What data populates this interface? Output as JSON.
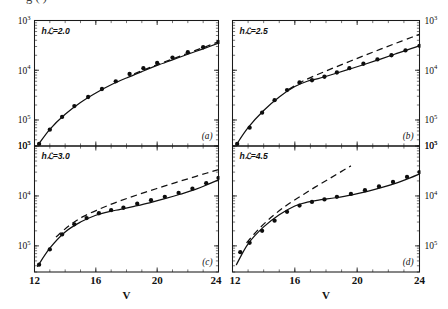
{
  "figure": {
    "clipped_caption_line": "g                                        (      )",
    "xlabel": "V",
    "panel_letters": [
      "(a)",
      "(b)",
      "(c)",
      "(d)"
    ],
    "y_tick_labels": [
      "10",
      "10",
      "10"
    ],
    "y_tick_exponents": [
      "5",
      "4",
      "3"
    ],
    "x_tick_labels": [
      "12",
      "16",
      "20",
      "24"
    ]
  },
  "chart_data": {
    "type": "line",
    "title": "",
    "xlabel": "V",
    "ylabel": "",
    "xlim": [
      12,
      24
    ],
    "ylim": [
      300,
      100000
    ],
    "yscale": "log",
    "xscale": "linear",
    "grid": false,
    "legend": "none",
    "xticks": [
      12,
      16,
      20,
      24
    ],
    "yticks": [
      1000,
      10000,
      100000
    ],
    "ytick_labels": [
      "10^3",
      "10^4",
      "10^5"
    ],
    "panels": [
      {
        "letter": "(a)",
        "label": "hℒ=2.0",
        "parameter": "hL",
        "parameter_value": 2.0,
        "series": [
          {
            "name": "data",
            "style": "filled-circles",
            "x": [
              12.3,
              13.0,
              13.8,
              14.6,
              15.5,
              16.4,
              17.3,
              18.2,
              19.1,
              20.0,
              21.0,
              22.0,
              23.0,
              24.0
            ],
            "y": [
              330,
              640,
              1150,
              1900,
              2900,
              4200,
              6000,
              8400,
              11000,
              14000,
              18000,
              23000,
              29000,
              37000
            ]
          },
          {
            "name": "solid-theory",
            "style": "solid-line",
            "x": [
              12.25,
              13.0,
              14.0,
              15.0,
              16.0,
              17.0,
              18.0,
              19.0,
              20.0,
              21.0,
              22.0,
              23.0,
              24.0
            ],
            "y": [
              320,
              650,
              1300,
              2250,
              3500,
              5100,
              7000,
              9400,
              12500,
              16200,
              21000,
              27000,
              35000
            ]
          },
          {
            "name": "dashed-theory",
            "style": "dashed-line",
            "x": [
              18.5,
              19.5,
              20.5,
              21.5,
              22.5,
              23.5,
              24.0
            ],
            "y": [
              8500,
              11300,
              14800,
              19200,
              25000,
              32500,
              37500
            ]
          }
        ]
      },
      {
        "letter": "(b)",
        "label": "hℒ=2.5",
        "parameter": "hL",
        "parameter_value": 2.5,
        "series": [
          {
            "name": "data",
            "style": "filled-circles",
            "x": [
              12.3,
              13.1,
              13.9,
              14.7,
              15.5,
              16.3,
              17.1,
              17.9,
              18.7,
              19.5,
              20.4,
              21.3,
              22.2,
              23.1,
              24.0
            ],
            "y": [
              330,
              700,
              1400,
              2500,
              4000,
              5700,
              6300,
              7400,
              9000,
              11000,
              13500,
              16500,
              20000,
              25000,
              31000
            ]
          },
          {
            "name": "solid-theory",
            "style": "solid-line",
            "x": [
              12.25,
              13.0,
              14.0,
              15.0,
              16.0,
              16.8,
              17.5,
              18.5,
              19.5,
              20.5,
              21.5,
              22.5,
              23.5,
              24.0
            ],
            "y": [
              320,
              700,
              1550,
              2900,
              4700,
              6000,
              6800,
              8400,
              10500,
              13200,
              16800,
              21500,
              27500,
              31000
            ]
          },
          {
            "name": "dashed-theory",
            "style": "dashed-line",
            "x": [
              15.6,
              16.5,
              17.5,
              18.5,
              19.5,
              20.5,
              21.5,
              22.5,
              23.5,
              24.0
            ],
            "y": [
              4100,
              6000,
              8300,
              11200,
              15000,
              20000,
              26500,
              35000,
              46000,
              53000
            ]
          }
        ]
      },
      {
        "letter": "(c)",
        "label": "hℒ=3.0",
        "parameter": "hL",
        "parameter_value": 3.0,
        "series": [
          {
            "name": "data",
            "style": "filled-circles",
            "x": [
              12.3,
              13.0,
              13.8,
              14.6,
              15.4,
              16.2,
              17.0,
              17.8,
              18.7,
              19.6,
              20.5,
              21.4,
              22.3,
              23.2,
              24.0
            ],
            "y": [
              420,
              850,
              1700,
              2700,
              3600,
              4500,
              5200,
              5800,
              7000,
              8200,
              9600,
              11500,
              14000,
              18000,
              23000
            ]
          },
          {
            "name": "solid-theory",
            "style": "solid-line",
            "x": [
              12.2,
              13.0,
              14.0,
              15.0,
              16.0,
              16.8,
              17.6,
              18.5,
              19.5,
              20.5,
              21.5,
              22.5,
              23.3,
              24.0
            ],
            "y": [
              390,
              900,
              1900,
              3000,
              4100,
              4800,
              5400,
              6200,
              7300,
              8800,
              10800,
              13500,
              17000,
              21000
            ]
          },
          {
            "name": "dashed-theory",
            "style": "dashed-line",
            "x": [
              13.4,
              14.3,
              15.2,
              16.2,
              17.2,
              18.2,
              19.2,
              20.2,
              21.2,
              22.2,
              23.2,
              24.0
            ],
            "y": [
              1500,
              2600,
              3900,
              5400,
              7200,
              9300,
              11800,
              14800,
              18500,
              23000,
              28500,
              33500
            ]
          }
        ]
      },
      {
        "letter": "(d)",
        "label": "hℒ=4.5",
        "parameter": "hL",
        "parameter_value": 4.5,
        "series": [
          {
            "name": "data",
            "style": "filled-circles",
            "x": [
              12.5,
              13.1,
              13.9,
              14.7,
              15.5,
              16.3,
              17.1,
              17.9,
              18.7,
              19.6,
              20.5,
              21.4,
              22.3,
              23.2,
              24.0
            ],
            "y": [
              750,
              1150,
              2000,
              3200,
              4800,
              6400,
              7600,
              8500,
              9600,
              11000,
              13000,
              15500,
              19000,
              24000,
              30000
            ]
          },
          {
            "name": "solid-theory",
            "style": "solid-line",
            "x": [
              12.25,
              13.0,
              14.0,
              15.0,
              16.0,
              16.8,
              17.6,
              18.6,
              19.6,
              20.6,
              21.6,
              22.6,
              23.4,
              24.0
            ],
            "y": [
              420,
              1100,
              2400,
              4200,
              6300,
              7500,
              8300,
              9200,
              10400,
              12200,
              14800,
              18500,
              23000,
              27500
            ]
          },
          {
            "name": "dashed-theory",
            "style": "dashed-line",
            "x": [
              12.9,
              13.7,
              14.6,
              15.5,
              16.4,
              17.3,
              18.2,
              19.0,
              19.6
            ],
            "y": [
              1150,
              2200,
              4000,
              6600,
              10000,
              15000,
              22000,
              31000,
              40000
            ]
          }
        ]
      }
    ]
  }
}
